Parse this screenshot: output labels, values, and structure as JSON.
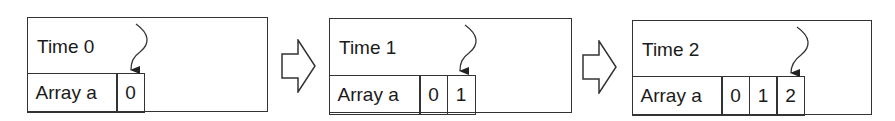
{
  "diagram": {
    "panels": [
      {
        "time_label": "Time 0",
        "array_label": "Array a",
        "values": [
          "0"
        ],
        "box": {
          "left": 27,
          "top": 17,
          "width": 241,
          "height": 95
        },
        "pointer_index": 0
      },
      {
        "time_label": "Time 1",
        "array_label": "Array a",
        "values": [
          "0",
          "1"
        ],
        "box": {
          "left": 329,
          "top": 18,
          "width": 243,
          "height": 95
        },
        "pointer_index": 1
      },
      {
        "time_label": "Time 2",
        "array_label": "Array a",
        "values": [
          "0",
          "1",
          "2"
        ],
        "box": {
          "left": 632,
          "top": 20,
          "width": 240,
          "height": 95
        },
        "pointer_index": 2
      }
    ],
    "transition_arrows": [
      {
        "from": "Time 0",
        "to": "Time 1"
      },
      {
        "from": "Time 1",
        "to": "Time 2"
      }
    ],
    "colors": {
      "stroke": "#333333",
      "background": "#ffffff",
      "text": "#1a1a1a"
    }
  }
}
